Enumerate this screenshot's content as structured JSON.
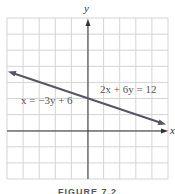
{
  "figure": {
    "caption": "FIGURE 7.2",
    "axis_labels": {
      "x": "x",
      "y": "y"
    },
    "equations": [
      {
        "text": "2x + 6y = 12"
      },
      {
        "text": "x = −3y + 6"
      }
    ],
    "colors": {
      "grid": "#d4d4d4",
      "axis": "#333333",
      "line": "#555566",
      "text": "#555555"
    }
  },
  "chart_data": {
    "type": "line",
    "title": "",
    "xlabel": "x",
    "ylabel": "y",
    "xlim": [
      -5,
      5
    ],
    "ylim": [
      -3,
      7
    ],
    "grid": true,
    "grid_step": 1,
    "series": [
      {
        "name": "2x + 6y = 12 (x = −3y + 6)",
        "x": [
          -5,
          0,
          5
        ],
        "y": [
          3.67,
          2,
          0.33
        ],
        "arrows": "both"
      }
    ],
    "annotations": [
      "2x + 6y = 12",
      "x = −3y + 6"
    ]
  }
}
